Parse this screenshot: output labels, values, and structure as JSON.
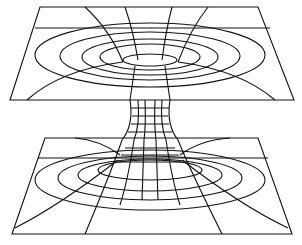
{
  "diagram": {
    "line_color": "#111111",
    "background": "#ffffff",
    "parts": [
      "upper-sheet",
      "throat",
      "lower-sheet"
    ]
  }
}
